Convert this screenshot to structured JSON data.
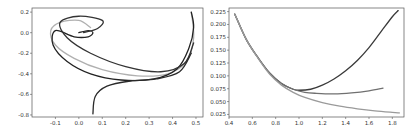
{
  "chart_data": [
    {
      "type": "line",
      "title": "",
      "xlabel": "",
      "ylabel": "",
      "xlim": [
        -0.2,
        0.53
      ],
      "ylim": [
        -0.82,
        0.24
      ],
      "grid": false,
      "legend": null,
      "xticks": [
        "-0.1",
        "0.0",
        "0.1",
        "0.2",
        "0.3",
        "0.4",
        "0.5"
      ],
      "yticks": [
        "0.2",
        "0.0",
        "-0.2",
        "-0.4",
        "-0.6",
        "-0.8"
      ],
      "series": [
        {
          "name": "trajectory-light",
          "color": "#b0b0b0",
          "points": [
            [
              0.05,
              0.05
            ],
            [
              0.0,
              0.12
            ],
            [
              -0.08,
              0.1
            ],
            [
              -0.12,
              0.02
            ],
            [
              -0.1,
              -0.12
            ],
            [
              -0.02,
              -0.25
            ],
            [
              0.1,
              -0.36
            ],
            [
              0.25,
              -0.42
            ],
            [
              0.38,
              -0.4
            ],
            [
              0.46,
              -0.28
            ],
            [
              0.49,
              -0.05
            ],
            [
              0.48,
              0.2
            ]
          ]
        },
        {
          "name": "trajectory-dark-1",
          "color": "#222222",
          "points": [
            [
              0.0,
              0.0
            ],
            [
              0.04,
              0.02
            ],
            [
              0.06,
              0.0
            ],
            [
              0.04,
              -0.04
            ],
            [
              -0.02,
              -0.04
            ],
            [
              -0.1,
              0.02
            ],
            [
              -0.11,
              -0.12
            ],
            [
              -0.05,
              -0.28
            ],
            [
              0.05,
              -0.4
            ],
            [
              0.18,
              -0.46
            ],
            [
              0.32,
              -0.45
            ],
            [
              0.42,
              -0.35
            ],
            [
              0.47,
              -0.15
            ],
            [
              0.49,
              0.05
            ],
            [
              0.48,
              0.2
            ]
          ]
        },
        {
          "name": "trajectory-dark-2",
          "color": "#333333",
          "points": [
            [
              0.02,
              0.0
            ],
            [
              0.08,
              0.04
            ],
            [
              0.1,
              0.12
            ],
            [
              0.0,
              0.16
            ],
            [
              -0.08,
              0.1
            ],
            [
              -0.05,
              -0.05
            ],
            [
              0.05,
              -0.2
            ],
            [
              0.2,
              -0.33
            ],
            [
              0.35,
              -0.38
            ],
            [
              0.45,
              -0.3
            ],
            [
              0.49,
              -0.1
            ]
          ]
        },
        {
          "name": "trajectory-dark-3",
          "color": "#2a2a2a",
          "points": [
            [
              0.06,
              -0.79
            ],
            [
              0.07,
              -0.62
            ],
            [
              0.12,
              -0.52
            ],
            [
              0.22,
              -0.47
            ],
            [
              0.33,
              -0.45
            ],
            [
              0.43,
              -0.38
            ],
            [
              0.48,
              -0.2
            ]
          ]
        }
      ]
    },
    {
      "type": "line",
      "title": "",
      "xlabel": "",
      "ylabel": "",
      "xlim": [
        0.4,
        1.9
      ],
      "ylim": [
        0.02,
        0.232
      ],
      "grid": false,
      "legend": null,
      "xticks": [
        "0.4",
        "0.6",
        "0.8",
        "1.0",
        "1.2",
        "1.4",
        "1.6",
        "1.8"
      ],
      "yticks": [
        "0.225",
        "0.200",
        "0.175",
        "0.150",
        "0.125",
        "0.100",
        "0.075",
        "0.050",
        "0.025"
      ],
      "series": [
        {
          "name": "curve-dark",
          "color": "#3a3a3a",
          "x": [
            0.45,
            0.55,
            0.65,
            0.75,
            0.85,
            0.95,
            1.0,
            1.1,
            1.2,
            1.3,
            1.4,
            1.5,
            1.6,
            1.7,
            1.8,
            1.85
          ],
          "values": [
            0.22,
            0.17,
            0.135,
            0.105,
            0.085,
            0.074,
            0.072,
            0.074,
            0.082,
            0.094,
            0.11,
            0.13,
            0.155,
            0.185,
            0.215,
            0.227
          ]
        },
        {
          "name": "curve-medium",
          "color": "#707070",
          "x": [
            0.45,
            0.55,
            0.65,
            0.75,
            0.85,
            0.95,
            1.05,
            1.15,
            1.3,
            1.45,
            1.6,
            1.72
          ],
          "values": [
            0.22,
            0.17,
            0.135,
            0.105,
            0.085,
            0.074,
            0.068,
            0.066,
            0.065,
            0.067,
            0.071,
            0.076
          ]
        },
        {
          "name": "curve-light",
          "color": "#9a9a9a",
          "x": [
            0.45,
            0.55,
            0.65,
            0.75,
            0.85,
            0.95,
            1.05,
            1.2,
            1.35,
            1.5,
            1.65,
            1.8,
            1.86
          ],
          "values": [
            0.22,
            0.17,
            0.134,
            0.103,
            0.082,
            0.068,
            0.058,
            0.048,
            0.041,
            0.036,
            0.032,
            0.029,
            0.028
          ]
        }
      ]
    }
  ]
}
